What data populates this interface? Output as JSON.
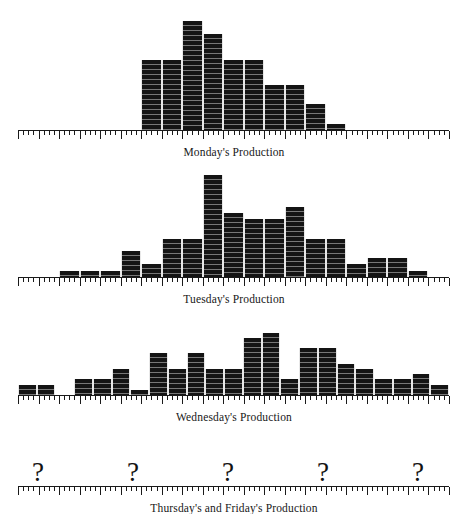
{
  "figure": {
    "axis": {
      "x_start_px": 18,
      "x_end_px": 449,
      "bins": 21,
      "minor_tick_per_bin": 1,
      "major_tick_every": 5,
      "ink_color": "#141414",
      "grid_line_color": "#e8e8e8"
    },
    "panels": [
      {
        "id": "monday",
        "caption": "Monday's Production",
        "unit_px": 6.4
      },
      {
        "id": "tuesday",
        "caption": "Tuesday's Production",
        "unit_px": 6.4
      },
      {
        "id": "wednesday",
        "caption": "Wednesday's Production",
        "unit_px": 6.4
      },
      {
        "id": "thursday-friday",
        "caption": "Thursday's and Friday's Production",
        "unknown_marker": "?",
        "unknown_marker_count": 5
      }
    ]
  },
  "chart_data": [
    {
      "type": "bar",
      "title": "Monday's Production",
      "xlabel": "",
      "ylabel": "",
      "grid": false,
      "legend": "none",
      "categories": [
        "1",
        "2",
        "3",
        "4",
        "5",
        "6",
        "7",
        "8",
        "9",
        "10",
        "11",
        "12",
        "13",
        "14",
        "15",
        "16",
        "17",
        "18",
        "19",
        "20",
        "21"
      ],
      "values": [
        0,
        0,
        0,
        0,
        0,
        0,
        11,
        11,
        17,
        15,
        11,
        11,
        7,
        7,
        4,
        1,
        0,
        0,
        0,
        0,
        0
      ],
      "ylim": [
        0,
        18
      ]
    },
    {
      "type": "bar",
      "title": "Tuesday's Production",
      "xlabel": "",
      "ylabel": "",
      "grid": false,
      "legend": "none",
      "categories": [
        "1",
        "2",
        "3",
        "4",
        "5",
        "6",
        "7",
        "8",
        "9",
        "10",
        "11",
        "12",
        "13",
        "14",
        "15",
        "16",
        "17",
        "18",
        "19",
        "20",
        "21"
      ],
      "values": [
        0,
        0,
        1,
        1,
        1,
        4,
        2,
        6,
        6,
        16,
        10,
        9,
        9,
        11,
        6,
        6,
        2,
        3,
        3,
        1,
        0
      ],
      "ylim": [
        0,
        18
      ]
    },
    {
      "type": "bar",
      "title": "Wednesday's Production",
      "xlabel": "",
      "ylabel": "",
      "grid": false,
      "legend": "none",
      "categories": [
        "1",
        "2",
        "3",
        "4",
        "5",
        "6",
        "7",
        "8",
        "9",
        "10",
        "11",
        "12",
        "13",
        "14",
        "15",
        "16",
        "17",
        "18",
        "19",
        "20",
        "21"
      ],
      "values": [
        2,
        2,
        0,
        3,
        3,
        5,
        1,
        8,
        5,
        8,
        5,
        5,
        11,
        12,
        3,
        9,
        9,
        6,
        5,
        3,
        3,
        4,
        2
      ],
      "ylim": [
        0,
        14
      ]
    },
    {
      "type": "bar",
      "title": "Thursday's and Friday's Production",
      "xlabel": "",
      "ylabel": "",
      "grid": false,
      "legend": "none",
      "categories": [],
      "values": [],
      "note": "Distribution not shown — marked with question marks",
      "markers": [
        "?",
        "?",
        "?",
        "?",
        "?"
      ],
      "marker_x_px": [
        38,
        133,
        228,
        323,
        418
      ]
    }
  ]
}
